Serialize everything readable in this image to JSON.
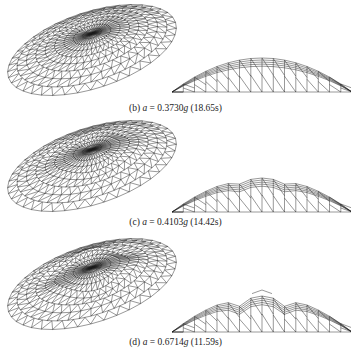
{
  "figure": {
    "panels": [
      {
        "id": "b",
        "label": "(b)",
        "symbol": "a",
        "eq": "=",
        "value": "0.3730",
        "unit": "g",
        "time": "(18.65s)",
        "deform": 0.0
      },
      {
        "id": "c",
        "label": "(c)",
        "symbol": "a",
        "eq": "=",
        "value": "0.4103",
        "unit": "g",
        "time": "(14.42s)",
        "deform": 0.5
      },
      {
        "id": "d",
        "label": "(d)",
        "symbol": "a",
        "eq": "=",
        "value": "0.6714",
        "unit": "g",
        "time": "(11.59s)",
        "deform": 1.0
      }
    ],
    "views": [
      "oblique-view",
      "elevation-view"
    ],
    "line_color": "#1a1a1a"
  }
}
